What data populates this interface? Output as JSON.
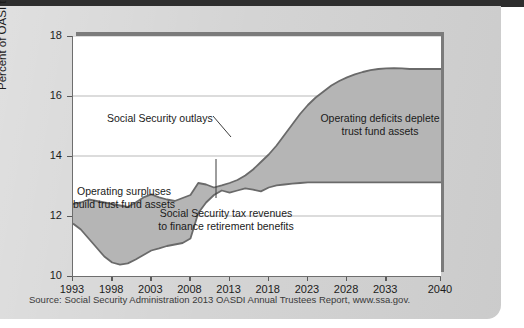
{
  "figure": {
    "source_note": "Source: Social Security Administration 2013 OASDI Annual Trustees Report, www.ssa.gov."
  },
  "chart_data": {
    "type": "area",
    "title": "",
    "xlabel": "",
    "ylabel": "Percent of OASI taxable payroll",
    "xlim": [
      1993,
      2040
    ],
    "ylim": [
      10,
      18
    ],
    "grid": true,
    "legend_position": "none",
    "xticks": [
      1993,
      1998,
      2003,
      2008,
      2013,
      2018,
      2023,
      2028,
      2033,
      2040
    ],
    "yticks": [
      10,
      12,
      14,
      16,
      18
    ],
    "x": [
      1993,
      1994,
      1995,
      1996,
      1997,
      1998,
      1999,
      2000,
      2001,
      2002,
      2003,
      2004,
      2005,
      2006,
      2007,
      2008,
      2009,
      2010,
      2011,
      2012,
      2013,
      2014,
      2015,
      2016,
      2017,
      2018,
      2019,
      2020,
      2021,
      2022,
      2023,
      2024,
      2025,
      2026,
      2027,
      2028,
      2029,
      2030,
      2031,
      2032,
      2033,
      2034,
      2035,
      2036,
      2037,
      2038,
      2039,
      2040
    ],
    "series": [
      {
        "name": "Social Security outlays",
        "values": [
          12.4,
          12.45,
          12.55,
          12.5,
          12.45,
          12.4,
          12.35,
          12.3,
          12.45,
          12.62,
          12.72,
          12.62,
          12.55,
          12.5,
          12.6,
          12.7,
          13.1,
          13.05,
          12.95,
          13.02,
          13.1,
          13.2,
          13.35,
          13.55,
          13.8,
          14.05,
          14.35,
          14.7,
          15.05,
          15.4,
          15.7,
          15.95,
          16.15,
          16.35,
          16.5,
          16.62,
          16.72,
          16.8,
          16.86,
          16.9,
          16.92,
          16.93,
          16.92,
          16.9,
          16.9,
          16.9,
          16.9,
          16.9
        ]
      },
      {
        "name": "Social Security tax revenues to finance retirement benefits",
        "values": [
          11.75,
          11.55,
          11.25,
          10.95,
          10.65,
          10.45,
          10.38,
          10.42,
          10.55,
          10.7,
          10.85,
          10.92,
          11.0,
          11.05,
          11.1,
          11.25,
          12.1,
          12.45,
          12.7,
          12.85,
          12.78,
          12.85,
          12.92,
          12.88,
          12.82,
          12.95,
          13.02,
          13.05,
          13.08,
          13.1,
          13.12,
          13.12,
          13.12,
          13.12,
          13.12,
          13.12,
          13.12,
          13.12,
          13.12,
          13.12,
          13.12,
          13.12,
          13.12,
          13.12,
          13.12,
          13.12,
          13.12,
          13.12
        ]
      }
    ],
    "annotations": [
      {
        "id": "outlays-label",
        "text": "Social Security outlays"
      },
      {
        "id": "surplus-label-line1",
        "text": "Operating surpluses"
      },
      {
        "id": "surplus-label-line2",
        "text": "build trust fund assets"
      },
      {
        "id": "deficit-label-line1",
        "text": "Operating deficits deplete"
      },
      {
        "id": "deficit-label-line2",
        "text": "trust fund assets"
      },
      {
        "id": "revenue-label-line1",
        "text": "Social Security tax revenues"
      },
      {
        "id": "revenue-label-line2",
        "text": "to finance retirement benefits"
      }
    ],
    "colors": {
      "area_fill": "#b5b5b5",
      "line_stroke": "#6a6a6a",
      "plot_background": "#ffffff",
      "card_background": "#d2d2d2",
      "gridline": "#b9b9b9"
    }
  }
}
